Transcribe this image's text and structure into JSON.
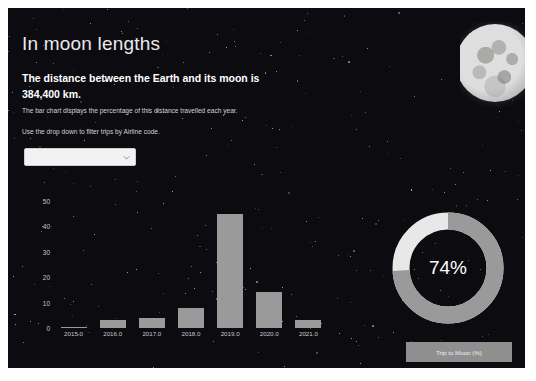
{
  "header": {
    "title": "In moon lengths",
    "lede": "The distance between the Earth and its moon is 384,400 km.",
    "sub1": "The bar chart displays the percentage of this distance travelled each year.",
    "sub2": "Use the drop down to filter trips by Airline code."
  },
  "filter": {
    "value": "",
    "placeholder": "",
    "icon": "chevron-down-icon"
  },
  "moon": {
    "icon": "full-moon-image"
  },
  "donut": {
    "value_label": "74%",
    "value": 74,
    "remainder": 26,
    "fill_color": "#9a9a9a",
    "track_color": "#e8e8e8"
  },
  "legend": {
    "label": "Trip to Moon (%)"
  },
  "chart_data": {
    "type": "bar",
    "title": "",
    "xlabel": "",
    "ylabel": "",
    "categories": [
      "2015.0",
      "2016.0",
      "2017.0",
      "2018.0",
      "2019.0",
      "2020.0",
      "2021.0"
    ],
    "values": [
      0.5,
      3,
      4,
      8,
      45,
      14,
      3
    ],
    "yticks": [
      0,
      10,
      20,
      30,
      40,
      50
    ],
    "ylim": [
      0,
      52
    ],
    "grid": false,
    "bar_color": "#9a9a9a"
  }
}
